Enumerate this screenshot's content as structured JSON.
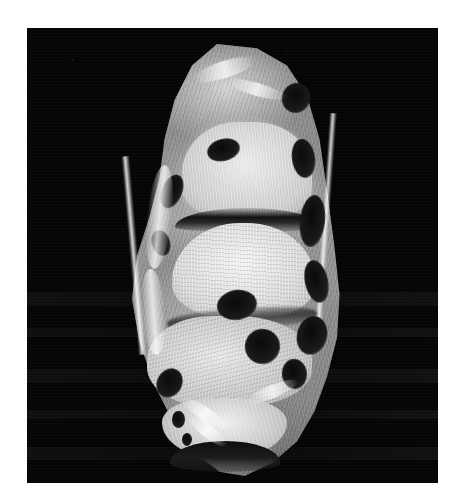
{
  "image": {
    "modality": "MRI",
    "view": "sagittal",
    "body_part": "ankle and hindfoot",
    "colorspace": "grayscale",
    "width_px": 460,
    "height_px": 502,
    "background_color": "#ffffff",
    "scan_field_color": "#050505",
    "scan_field": {
      "left_px": 27,
      "top_px": 28,
      "width_px": 411,
      "height_px": 455
    },
    "overlay_text": "",
    "annotations": []
  },
  "structures": [
    {
      "id": "soft-tissue",
      "label": "soft tissue envelope",
      "signal": "intermediate"
    },
    {
      "id": "tibia",
      "label": "distal tibia",
      "signal": "high"
    },
    {
      "id": "joint-space-tibiotalar",
      "label": "tibiotalar joint space",
      "signal": "low"
    },
    {
      "id": "talus",
      "label": "talus",
      "signal": "high"
    },
    {
      "id": "joint-space-subtalar",
      "label": "subtalar joint space",
      "signal": "low"
    },
    {
      "id": "calcaneus",
      "label": "calcaneus",
      "signal": "high"
    },
    {
      "id": "heel-pad",
      "label": "plantar heel fat pad",
      "signal": "high"
    },
    {
      "id": "plantar-crescent",
      "label": "plantar skin surface",
      "signal": "low"
    },
    {
      "id": "achilles",
      "label": "Achilles tendon",
      "signal": "low"
    }
  ],
  "voids": [
    {
      "left": "70%",
      "top": "9%",
      "w": "11%",
      "h": "7%",
      "rot": "18deg"
    },
    {
      "left": "74%",
      "top": "22%",
      "w": "9%",
      "h": "9%",
      "rot": "-8deg"
    },
    {
      "left": "77%",
      "top": "35%",
      "w": "10%",
      "h": "12%",
      "rot": "6deg"
    },
    {
      "left": "79%",
      "top": "50%",
      "w": "9%",
      "h": "10%",
      "rot": "-12deg"
    },
    {
      "left": "76%",
      "top": "63%",
      "w": "12%",
      "h": "9%",
      "rot": "14deg"
    },
    {
      "left": "70%",
      "top": "73%",
      "w": "10%",
      "h": "7%",
      "rot": "-6deg"
    },
    {
      "left": "22%",
      "top": "30%",
      "w": "8%",
      "h": "8%",
      "rot": "22deg"
    },
    {
      "left": "18%",
      "top": "43%",
      "w": "7%",
      "h": "6%",
      "rot": "-16deg"
    },
    {
      "left": "20%",
      "top": "75%",
      "w": "10%",
      "h": "7%",
      "rot": "28deg"
    },
    {
      "left": "26%",
      "top": "85%",
      "w": "5%",
      "h": "4%",
      "rot": "0deg"
    },
    {
      "left": "30%",
      "top": "90%",
      "w": "4%",
      "h": "3%",
      "rot": "0deg"
    },
    {
      "left": "44%",
      "top": "57%",
      "w": "16%",
      "h": "7%",
      "rot": "-9deg"
    },
    {
      "left": "55%",
      "top": "66%",
      "w": "14%",
      "h": "8%",
      "rot": "8deg"
    },
    {
      "left": "40%",
      "top": "22%",
      "w": "13%",
      "h": "5%",
      "rot": "-14deg"
    }
  ],
  "streaks": [
    {
      "left": "16%",
      "top": "28%",
      "w": "10%",
      "h": "24%",
      "rot": "6deg"
    },
    {
      "left": "14%",
      "top": "52%",
      "w": "9%",
      "h": "20%",
      "rot": "-4deg"
    },
    {
      "left": "34%",
      "top": "4%",
      "w": "26%",
      "h": "4%",
      "rot": "-18deg"
    },
    {
      "left": "48%",
      "top": "9%",
      "w": "24%",
      "h": "3%",
      "rot": "16deg"
    },
    {
      "left": "28%",
      "top": "84%",
      "w": "22%",
      "h": "3%",
      "rot": "34deg"
    },
    {
      "left": "30%",
      "top": "88%",
      "w": "20%",
      "h": "3%",
      "rot": "38deg"
    },
    {
      "left": "55%",
      "top": "79%",
      "w": "22%",
      "h": "3%",
      "rot": "-22deg"
    }
  ],
  "bands": [
    {
      "top": "58%",
      "h": "3%"
    },
    {
      "top": "66%",
      "h": "2%"
    },
    {
      "top": "75%",
      "h": "3%"
    },
    {
      "top": "84%",
      "h": "2%"
    },
    {
      "top": "92%",
      "h": "3%"
    }
  ]
}
